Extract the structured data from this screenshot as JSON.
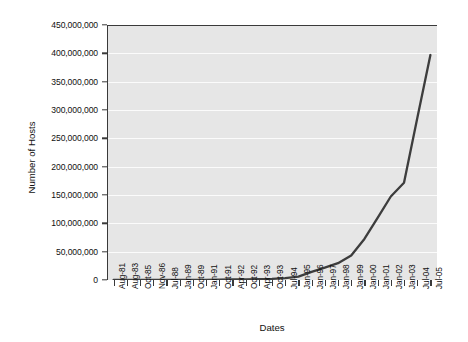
{
  "chart_data": {
    "type": "line",
    "title": "",
    "xlabel": "Dates",
    "ylabel": "Number of Hosts",
    "grid": true,
    "legend": false,
    "ylim": [
      0,
      450000000
    ],
    "yticks": [
      0,
      50000000,
      100000000,
      150000000,
      200000000,
      250000000,
      300000000,
      350000000,
      400000000,
      450000000
    ],
    "ytick_labels": [
      "0",
      "50,000,000",
      "100,000,000",
      "150,000,000",
      "200,000,000",
      "250,000,000",
      "300,000,000",
      "350,000,000",
      "400,000,000",
      "450,000,000"
    ],
    "categories": [
      "Aug-81",
      "Aug-83",
      "Oct-85",
      "Nov-86",
      "Jul-88",
      "Jan-89",
      "Oct-89",
      "Jan-91",
      "Oct-91",
      "Apr-92",
      "Oct-92",
      "Apr-93",
      "Oct-93",
      "Jul-94",
      "Jan-95",
      "Jan-96",
      "Jan-97",
      "Jan-98",
      "Jan-99",
      "Jan-00",
      "Jan-01",
      "Jan-02",
      "Jan-03",
      "Jul-04",
      "Jul-05"
    ],
    "series": [
      {
        "name": "Number of Hosts",
        "color": "#3d3d3d",
        "values": [
          213,
          562,
          1961,
          5089,
          33000,
          80000,
          159000,
          376000,
          617000,
          890000,
          1136000,
          1486000,
          2056000,
          3212000,
          5846000,
          14352000,
          21819000,
          29670000,
          43230000,
          72398000,
          109574000,
          147345000,
          171638000,
          285139000,
          397000000
        ]
      }
    ]
  }
}
